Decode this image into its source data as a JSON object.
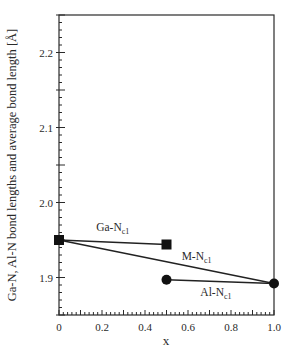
{
  "chart_data": {
    "type": "line",
    "title": "",
    "xlabel": "x",
    "ylabel": "Ga-N, Al-N bond lengths and average bond length  [Å]",
    "xlim": [
      0,
      1.0
    ],
    "ylim": [
      1.85,
      2.25
    ],
    "x_ticks": [
      "0",
      "0.2",
      "0.4",
      "0.6",
      "0.8",
      "1.0"
    ],
    "y_ticks": [
      "1.9",
      "2.0",
      "2.1",
      "2.2"
    ],
    "grid": false,
    "legend": null,
    "series": [
      {
        "name": "Ga-N_c1",
        "label_main": "Ga-N",
        "label_sub": "c1",
        "marker": "square",
        "x": [
          0,
          0.5
        ],
        "y": [
          1.95,
          1.944
        ]
      },
      {
        "name": "M-N_c1",
        "label_main": "M-N",
        "label_sub": "c1",
        "marker": "none",
        "x": [
          0,
          1.0
        ],
        "y": [
          1.95,
          1.892
        ]
      },
      {
        "name": "Al-N_c1",
        "label_main": "Al-N",
        "label_sub": "c1",
        "marker": "circle",
        "x": [
          0.5,
          1.0
        ],
        "y": [
          1.897,
          1.892
        ]
      }
    ],
    "annotations": [
      {
        "text": "Ga-N",
        "sub": "c1",
        "x": 0.25,
        "y": 1.962
      },
      {
        "text": "M-N",
        "sub": "c1",
        "x": 0.64,
        "y": 1.923
      },
      {
        "text": "Al-N",
        "sub": "c1",
        "x": 0.73,
        "y": 1.875
      }
    ]
  },
  "colors": {
    "axis": "#2a2a2a",
    "line": "#222222",
    "marker": "#111111"
  }
}
